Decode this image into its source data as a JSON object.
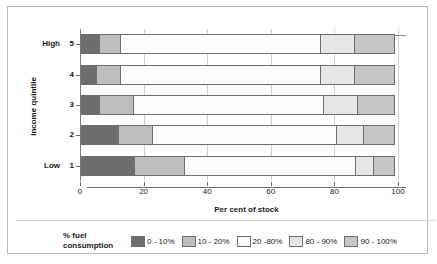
{
  "chart_data": {
    "type": "bar",
    "orientation": "horizontal",
    "stacked": true,
    "stack_mode": "percent",
    "title": "",
    "xlabel": "Per cent of stock",
    "ylabel": "Income quintile",
    "xlim": [
      0,
      100
    ],
    "xticks": [
      0,
      20,
      40,
      60,
      80,
      100
    ],
    "xtick_labels": [
      "0",
      "20",
      "40",
      "60",
      "80",
      "100"
    ],
    "grid": true,
    "legend_position": "bottom",
    "legend_title": "% fuel consumption",
    "categories": [
      "1",
      "2",
      "3",
      "4",
      "5"
    ],
    "category_end_labels": {
      "low": "Low",
      "high": "High"
    },
    "series": [
      {
        "name": "0 - 10%",
        "color": "#6e6e6e",
        "values": [
          17,
          12,
          6,
          5,
          6
        ]
      },
      {
        "name": "10 - 20%",
        "color": "#bdbdbd",
        "values": [
          16,
          11,
          11,
          8,
          7
        ]
      },
      {
        "name": "20 -80%",
        "color": "#fbfbfb",
        "values": [
          54,
          58,
          60,
          63,
          63
        ]
      },
      {
        "name": "80 - 90%",
        "color": "#e6e6e6",
        "values": [
          6,
          9,
          11,
          11,
          11
        ]
      },
      {
        "name": "90 - 100%",
        "color": "#c6c6c6",
        "values": [
          7,
          10,
          12,
          13,
          13
        ]
      }
    ]
  },
  "axis": {
    "x_title": "Per cent of stock",
    "y_title": "Income quintile",
    "x_ticks": [
      "0",
      "20",
      "40",
      "60",
      "80",
      "100"
    ],
    "y_ticks": [
      "5",
      "4",
      "3",
      "2",
      "1"
    ],
    "y_top_label": "High",
    "y_bottom_label": "Low"
  },
  "legend": {
    "title_line1": "% fuel",
    "title_line2": "consumption",
    "items": [
      {
        "label": "0 - 10%",
        "color": "#6e6e6e"
      },
      {
        "label": "10 - 20%",
        "color": "#bdbdbd"
      },
      {
        "label": "20 -80%",
        "color": "#fbfbfb"
      },
      {
        "label": "80 - 90%",
        "color": "#e6e6e6"
      },
      {
        "label": "90 - 100%",
        "color": "#c6c6c6"
      }
    ]
  }
}
